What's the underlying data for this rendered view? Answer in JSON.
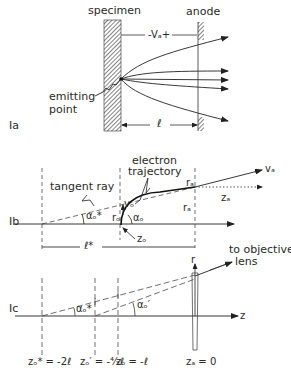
{
  "figure": {
    "panel_a": {
      "id": "Ia",
      "specimen_label": "specimen",
      "anode_label": "anode",
      "voltage_label": "-Vₐ+",
      "emitting_label_line1": "emitting",
      "emitting_label_line2": "point",
      "distance_label": "ℓ"
    },
    "panel_b": {
      "id": "Ib",
      "tangent_label": "tangent ray",
      "trajectory_line1": "electron",
      "trajectory_line2": "trajectory",
      "v_a": "vₐ",
      "r_a_top": "rₐ",
      "r_a_side": "rₐ",
      "z_a": "zₐ",
      "v_o": "vₒ",
      "r_o": "rₒ",
      "alpha_star": "αₒ*",
      "alpha_o": "αₒ",
      "z_o": "zₒ",
      "l_star": "ℓ*"
    },
    "panel_c": {
      "id": "Ic",
      "objective_line1": "to objective",
      "objective_line2": "lens",
      "r_axis": "r",
      "z_axis": "z",
      "alpha_star": "αₒ*",
      "alpha_prime": "αₒ′",
      "tick_1": "zₒ* = -2ℓ",
      "tick_2": "zₒ′ = -⁴⁄₃ℓ",
      "tick_3": "zₒ = -ℓ",
      "tick_4": "zₐ = 0"
    }
  }
}
